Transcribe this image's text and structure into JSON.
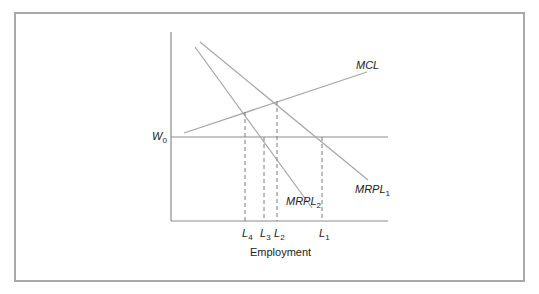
{
  "diagram": {
    "type": "labor-market-monopsony",
    "x_axis_title": "Employment",
    "y_axis_labels": [
      {
        "id": "w0",
        "main": "W",
        "sub": "0"
      }
    ],
    "x_axis_labels": [
      {
        "id": "l4",
        "main": "L",
        "sub": "4"
      },
      {
        "id": "l3",
        "main": "L",
        "sub": "3"
      },
      {
        "id": "l2",
        "main": "L",
        "sub": "2"
      },
      {
        "id": "l1",
        "main": "L",
        "sub": "1"
      }
    ],
    "curves": [
      {
        "id": "mcl",
        "main": "MCL",
        "sub": ""
      },
      {
        "id": "mrpl1",
        "main": "MRPL",
        "sub": "1"
      },
      {
        "id": "mrpl2",
        "main": "MRPL",
        "sub": "2"
      }
    ],
    "colors": {
      "curve": "#a6a6a6",
      "axis": "#8c8c8c",
      "wage_line": "#8c8c8c",
      "dashed": "#7a7a7a",
      "frame": "#a9a9a9",
      "text": "#222222"
    }
  }
}
